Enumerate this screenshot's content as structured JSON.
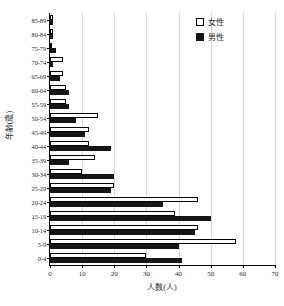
{
  "chart_data": {
    "type": "bar",
    "orientation": "horizontal",
    "title": "",
    "xlabel": "人数(人)",
    "ylabel": "年齢(歳)",
    "xlim": [
      0,
      70
    ],
    "xticks": [
      0,
      10,
      20,
      30,
      40,
      50,
      60,
      70
    ],
    "grid": true,
    "legend_position": "top-right",
    "categories": [
      "85-89",
      "80-84",
      "75-79",
      "70-74",
      "65-69",
      "60-64",
      "55-59",
      "50-54",
      "45-49",
      "40-44",
      "35-39",
      "30-34",
      "25-29",
      "20-24",
      "15-19",
      "10-14",
      "5-9",
      "0-4"
    ],
    "series": [
      {
        "name": "女性",
        "color": "#ffffff",
        "edge_color": "#000000",
        "values": [
          1,
          1,
          0,
          4,
          4,
          5,
          5,
          15,
          12,
          12,
          14,
          10,
          20,
          46,
          39,
          46,
          58,
          30
        ]
      },
      {
        "name": "男性",
        "color": "#151515",
        "edge_color": "#151515",
        "values": [
          1,
          1,
          2,
          1,
          3,
          6,
          6,
          8,
          11,
          19,
          6,
          20,
          19,
          35,
          50,
          45,
          40,
          41
        ]
      }
    ]
  },
  "legend": {
    "entries": [
      {
        "label": "女性",
        "swatch": "open-square-icon"
      },
      {
        "label": "男性",
        "swatch": "filled-square-icon"
      }
    ]
  }
}
